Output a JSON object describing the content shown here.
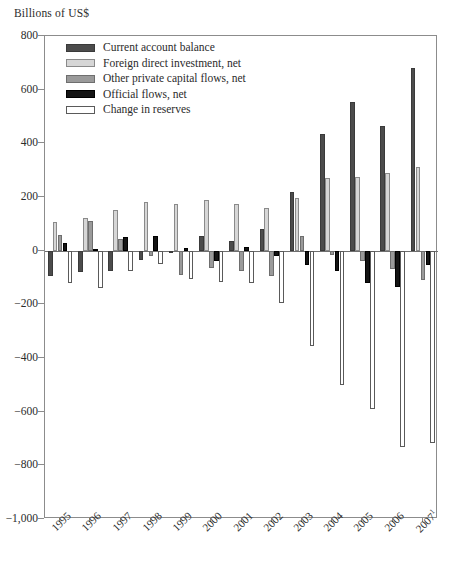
{
  "axis_title": "Billions of US$",
  "legend": {
    "position": "top-left-inside",
    "entries": [
      {
        "label": "Current account balance",
        "color": "#4c4c4c",
        "swatch": "swatch-current-account-balance"
      },
      {
        "label": "Foreign direct investment, net",
        "color": "#d6d6d6",
        "swatch": "swatch-foreign-direct-investment"
      },
      {
        "label": "Other private capital flows, net",
        "color": "#9a9a9a",
        "swatch": "swatch-other-private-capital-flows"
      },
      {
        "label": "Official flows, net",
        "color": "#141414",
        "swatch": "swatch-official-flows"
      },
      {
        "label": "Change in reserves",
        "color": "#ffffff",
        "swatch": "swatch-change-in-reserves"
      }
    ]
  },
  "chart_data": {
    "type": "bar",
    "title": "",
    "subtitle": "",
    "xlabel": "",
    "ylabel": "Billions of US$",
    "ylim": [
      -1000,
      800
    ],
    "ytick_step": 200,
    "yticks": [
      800,
      600,
      400,
      200,
      0,
      -200,
      -400,
      -600,
      -800,
      -1000
    ],
    "ytick_labels": [
      "800",
      "600",
      "400",
      "200",
      "0",
      "−200",
      "−400",
      "−600",
      "−800",
      "−1,000"
    ],
    "grid": false,
    "zero_line": true,
    "categories": [
      "1995",
      "1996",
      "1997",
      "1998",
      "1999",
      "2000",
      "2001",
      "2002",
      "2003",
      "2004",
      "2005",
      "2006",
      "2007"
    ],
    "category_labels": [
      "1995",
      "1996",
      "1997",
      "1998",
      "1999",
      "2000",
      "2001",
      "2002",
      "2003",
      "2004",
      "2005",
      "2006",
      "2007¹"
    ],
    "category_note": "2007 value carries footnote marker 1",
    "series": [
      {
        "name": "Current account balance",
        "color": "#4c4c4c",
        "values": [
          -95,
          -80,
          -75,
          -35,
          -10,
          55,
          35,
          80,
          220,
          435,
          555,
          465,
          680
        ]
      },
      {
        "name": "Foreign direct investment, net",
        "color": "#d6d6d6",
        "values": [
          105,
          120,
          150,
          180,
          175,
          190,
          175,
          160,
          195,
          270,
          275,
          290,
          310
        ]
      },
      {
        "name": "Other private capital flows, net",
        "color": "#9a9a9a",
        "values": [
          60,
          110,
          45,
          -20,
          -90,
          -65,
          -75,
          -95,
          55,
          -15,
          -40,
          -70,
          -110
        ]
      },
      {
        "name": "Official flows, net",
        "color": "#141414",
        "values": [
          30,
          5,
          50,
          55,
          10,
          -40,
          15,
          -20,
          -55,
          -75,
          -120,
          -135,
          -55
        ]
      },
      {
        "name": "Change in reserves",
        "color": "#ffffff",
        "values": [
          -120,
          -140,
          -75,
          -50,
          -105,
          -115,
          -120,
          -195,
          -355,
          -500,
          -590,
          -730,
          -715
        ]
      }
    ]
  }
}
